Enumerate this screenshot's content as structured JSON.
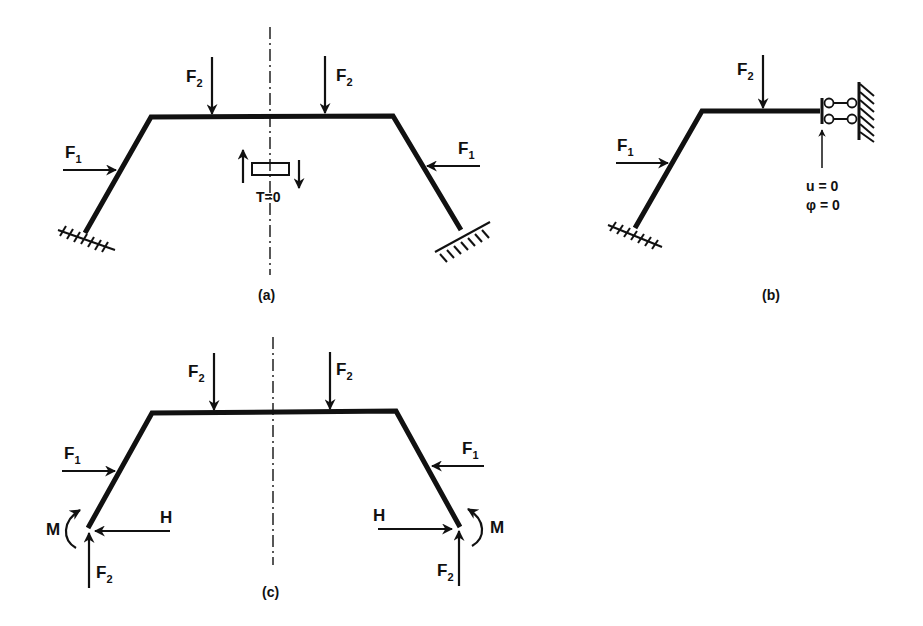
{
  "figure": {
    "panels": [
      {
        "id": "a",
        "caption": "(a)",
        "description": "Symmetric portal frame with fixed supports, loaded by two F2 and two F1 forces",
        "labels": {
          "f2_left": "F",
          "f2_left_sub": "2",
          "f2_right": "F",
          "f2_right_sub": "2",
          "f1_left": "F",
          "f1_left_sub": "1",
          "f1_right": "F",
          "f1_right_sub": "1",
          "shear": "T=0"
        }
      },
      {
        "id": "b",
        "caption": "(b)",
        "description": "Half frame with sliding (guided) support at symmetry axis",
        "labels": {
          "f2": "F",
          "f2_sub": "2",
          "f1": "F",
          "f1_sub": "1",
          "condition_u": "u = 0",
          "condition_phi": "φ = 0"
        }
      },
      {
        "id": "c",
        "caption": "(c)",
        "description": "Free-body diagram with support reactions",
        "labels": {
          "f2_top_left": "F",
          "f2_top_left_sub": "2",
          "f2_top_right": "F",
          "f2_top_right_sub": "2",
          "f1_left": "F",
          "f1_left_sub": "1",
          "f1_right": "F",
          "f1_right_sub": "1",
          "moment_left": "M",
          "moment_right": "M",
          "h_left": "H",
          "h_right": "H",
          "f2_base_left": "F",
          "f2_base_left_sub": "2",
          "f2_base_right": "F",
          "f2_base_right_sub": "2"
        }
      }
    ]
  },
  "colors": {
    "ink": "#111111",
    "background": "#ffffff"
  }
}
